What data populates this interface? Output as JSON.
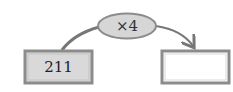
{
  "diagram": {
    "input_box": {
      "value": "211",
      "fill": "#d9d9d9",
      "border": "#8c8c8c"
    },
    "operation": {
      "label": "×4",
      "fill": "#d6d6d6",
      "border": "#8c8c8c"
    },
    "output_box": {
      "value": "",
      "fill": "#ffffff",
      "border": "#8c8c8c"
    },
    "connector_color": "#777777"
  }
}
